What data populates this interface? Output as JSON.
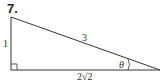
{
  "problem": {
    "number": "7."
  },
  "triangle": {
    "side_vertical": "1",
    "hypotenuse": "3",
    "base": "2√2",
    "angle": "θ",
    "right_angle_marker": "bottom-left"
  },
  "colors": {
    "stroke": "#333333",
    "background": "#ffffff"
  }
}
